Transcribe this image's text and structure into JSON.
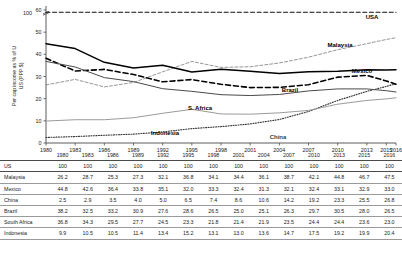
{
  "chart_data": {
    "type": "line",
    "title": "",
    "xlabel": "",
    "ylabel": "Per cap income as % of U\nUS (PPP $)",
    "ylabel_line1": "Per cap income as % of U",
    "ylabel_line2": "US (PPP $)",
    "x": [
      "1980",
      "1983",
      "1986",
      "1989",
      "1992",
      "1995",
      "1998",
      "2001",
      "2004",
      "2007",
      "2010",
      "2013",
      "2015",
      "2016"
    ],
    "ylim": [
      0,
      60
    ],
    "yticks": [
      0,
      10,
      20,
      30,
      40,
      50,
      60
    ],
    "broken_axis_label": "100",
    "grid": false,
    "legend": "inline-labels",
    "series": [
      {
        "name": "USA",
        "label": "USA",
        "values": [
          100,
          100,
          100,
          100,
          100,
          100,
          100,
          100,
          100,
          100,
          100,
          100,
          100,
          100
        ],
        "style": "dashed",
        "color": "#111111",
        "width": 1.1,
        "plot_at": 59.0
      },
      {
        "name": "Malaysia",
        "label": "Malaysia",
        "values": [
          26.2,
          28.7,
          25.3,
          27.3,
          32.1,
          36.8,
          34.1,
          34.4,
          36.1,
          38.7,
          42.1,
          44.8,
          46.7,
          47.5
        ],
        "style": "dashed-fine",
        "color": "#8a8a8a",
        "width": 0.9
      },
      {
        "name": "Mexico",
        "label": "Mexico",
        "values": [
          44.8,
          42.6,
          36.4,
          33.8,
          35.1,
          32.0,
          33.3,
          32.4,
          31.3,
          32.1,
          32.4,
          33.1,
          32.9,
          33.0
        ],
        "style": "solid",
        "color": "#000000",
        "width": 1.5
      },
      {
        "name": "China",
        "label": "China",
        "values": [
          2.5,
          2.9,
          3.5,
          4.0,
          5.0,
          6.5,
          7.4,
          8.6,
          10.6,
          14.2,
          19.2,
          23.3,
          25.5,
          26.8
        ],
        "style": "dotted",
        "color": "#333333",
        "width": 1.1
      },
      {
        "name": "Brazil",
        "label": "Brazil",
        "values": [
          38.2,
          32.5,
          33.2,
          30.9,
          27.6,
          28.6,
          26.5,
          25.0,
          25.1,
          26.3,
          29.7,
          30.5,
          28.0,
          26.5
        ],
        "style": "dashed-bold",
        "color": "#000000",
        "width": 1.6
      },
      {
        "name": "South Africa",
        "label": "S. Africa",
        "values": [
          36.8,
          34.3,
          29.5,
          27.7,
          24.5,
          23.3,
          21.8,
          21.4,
          21.9,
          23.5,
          24.4,
          24.4,
          23.6,
          23.0
        ],
        "style": "solid",
        "color": "#4a4a4a",
        "width": 1.0
      },
      {
        "name": "Indonesia",
        "label": "Indonesia",
        "values": [
          9.9,
          10.5,
          10.5,
          11.4,
          13.4,
          15.2,
          13.1,
          13.0,
          13.6,
          14.7,
          17.5,
          19.2,
          19.9,
          20.4
        ],
        "style": "solid",
        "color": "#9a9a9a",
        "width": 1.0
      }
    ],
    "annotations": [
      {
        "text": "USA",
        "x": 2016,
        "y": 59.0
      },
      {
        "text": "Malaysia",
        "x": 2013,
        "y": 44.8
      },
      {
        "text": "Mexico",
        "x": 2013,
        "y": 33.1
      },
      {
        "text": "Brazil",
        "x": 2007,
        "y": 26.3
      },
      {
        "text": "S. Africa",
        "x": 1998,
        "y": 21.8
      },
      {
        "text": "Indonesia",
        "x": 1995,
        "y": 15.2
      },
      {
        "text": "China",
        "x": 2007,
        "y": 14.2
      }
    ]
  },
  "table": {
    "columns": [
      "",
      "1980",
      "1983",
      "1986",
      "1989",
      "1992",
      "1995",
      "1998",
      "2001",
      "2004",
      "2007",
      "2010",
      "2013",
      "2015",
      "2016"
    ],
    "rows": [
      {
        "label": "US",
        "values": [
          "100",
          "100",
          "100",
          "100",
          "100",
          "100",
          "100",
          "100",
          "100",
          "100",
          "100",
          "100",
          "100",
          "100"
        ]
      },
      {
        "label": "Malaysia",
        "values": [
          "26.2",
          "28.7",
          "25.3",
          "27.3",
          "32.1",
          "36.8",
          "34.1",
          "34.4",
          "36.1",
          "38.7",
          "42.1",
          "44.8",
          "46.7",
          "47.5"
        ]
      },
      {
        "label": "Mexico",
        "values": [
          "44.8",
          "42.6",
          "36.4",
          "33.8",
          "35.1",
          "32.0",
          "33.3",
          "32.4",
          "31.3",
          "32.1",
          "32.4",
          "33.1",
          "32.9",
          "33.0"
        ]
      },
      {
        "label": "China",
        "values": [
          "2.5",
          "2.9",
          "3.5",
          "4.0",
          "5.0",
          "6.5",
          "7.4",
          "8.6",
          "10.6",
          "14.2",
          "19.2",
          "23.3",
          "25.5",
          "26.8"
        ]
      },
      {
        "label": "Brazil",
        "values": [
          "38.2",
          "32.5",
          "33.2",
          "30.9",
          "27.6",
          "28.6",
          "26.5",
          "25.0",
          "25.1",
          "26.3",
          "29.7",
          "30.5",
          "28.0",
          "26.5"
        ]
      },
      {
        "label": "South Africa",
        "values": [
          "36.8",
          "34.3",
          "29.5",
          "27.7",
          "24.5",
          "23.3",
          "21.8",
          "21.4",
          "21.9",
          "23.5",
          "24.4",
          "24.4",
          "23.6",
          "23.0"
        ]
      },
      {
        "label": "Indonesia",
        "values": [
          "9.9",
          "10.5",
          "10.5",
          "11.4",
          "13.4",
          "15.2",
          "13.1",
          "13.0",
          "13.6",
          "14.7",
          "17.5",
          "19.2",
          "19.9",
          "20.4"
        ]
      }
    ]
  },
  "colors": {
    "axis": "#4a4a4a",
    "text": "#1a1a1a",
    "rule": "#9a9a9a"
  }
}
